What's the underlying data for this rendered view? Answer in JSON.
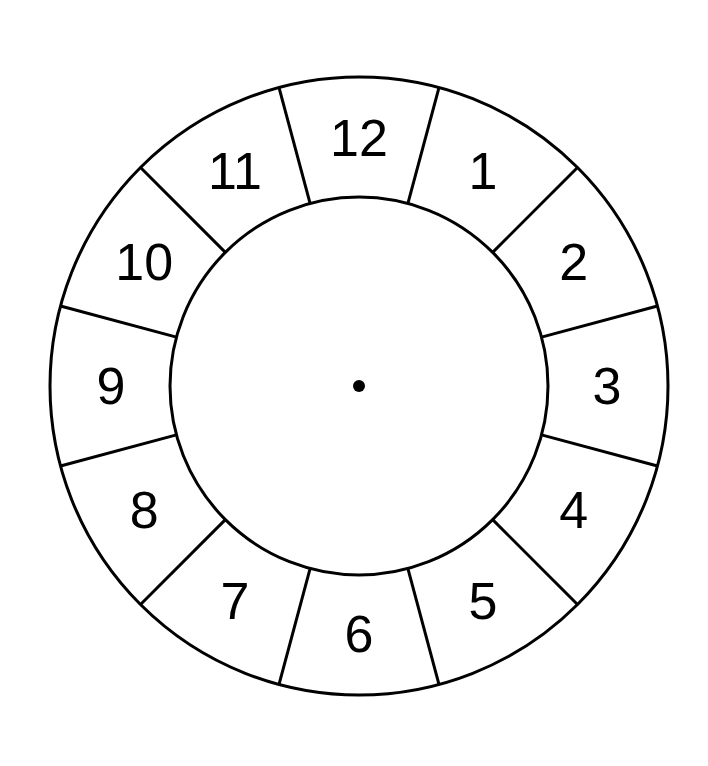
{
  "figure": {
    "name": "clock-face-diagram",
    "background_color": "#ffffff",
    "stroke_color": "#000000",
    "fill_color": "#ffffff",
    "text_color": "#000000"
  },
  "geometry": {
    "center_x": 359,
    "center_y": 386,
    "outer_radius": 309,
    "inner_radius": 189,
    "numeral_radius": 248,
    "outer_stroke_width": 3,
    "inner_stroke_width": 3,
    "divider_stroke_width": 3,
    "center_dot_radius": 6,
    "numeral_font_size": 52,
    "segment_count": 12,
    "segment_angle_degrees": 30,
    "divider_offset_degrees": 15
  },
  "chart_data": {
    "type": "pie",
    "title": "",
    "subtitle": "",
    "xlabel": "",
    "ylabel": "",
    "legend_position": "none",
    "grid": false,
    "categories": [
      "12",
      "1",
      "2",
      "3",
      "4",
      "5",
      "6",
      "7",
      "8",
      "9",
      "10",
      "11"
    ],
    "values": [
      30,
      30,
      30,
      30,
      30,
      30,
      30,
      30,
      30,
      30,
      30,
      30
    ],
    "annotations": [
      "center-dot"
    ]
  },
  "numerals": [
    {
      "label": "12",
      "angle_deg": 0,
      "hour": 12
    },
    {
      "label": "1",
      "angle_deg": 30,
      "hour": 1
    },
    {
      "label": "2",
      "angle_deg": 60,
      "hour": 2
    },
    {
      "label": "3",
      "angle_deg": 90,
      "hour": 3
    },
    {
      "label": "4",
      "angle_deg": 120,
      "hour": 4
    },
    {
      "label": "5",
      "angle_deg": 150,
      "hour": 5
    },
    {
      "label": "6",
      "angle_deg": 180,
      "hour": 6
    },
    {
      "label": "7",
      "angle_deg": 210,
      "hour": 7
    },
    {
      "label": "8",
      "angle_deg": 240,
      "hour": 8
    },
    {
      "label": "9",
      "angle_deg": 270,
      "hour": 9
    },
    {
      "label": "10",
      "angle_deg": 300,
      "hour": 10
    },
    {
      "label": "11",
      "angle_deg": 330,
      "hour": 11
    }
  ],
  "dividers": [
    {
      "angle_deg": 15
    },
    {
      "angle_deg": 45
    },
    {
      "angle_deg": 75
    },
    {
      "angle_deg": 105
    },
    {
      "angle_deg": 135
    },
    {
      "angle_deg": 165
    },
    {
      "angle_deg": 195
    },
    {
      "angle_deg": 225
    },
    {
      "angle_deg": 255
    },
    {
      "angle_deg": 285
    },
    {
      "angle_deg": 315
    },
    {
      "angle_deg": 345
    }
  ]
}
